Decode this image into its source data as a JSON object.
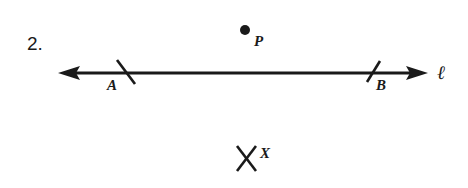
{
  "problem": {
    "number": "2."
  },
  "diagram": {
    "line": {
      "label": "ℓ",
      "x1": 58,
      "y1": 73,
      "x2": 428,
      "y2": 73,
      "arrows": "both"
    },
    "points": [
      {
        "name": "A",
        "label": "A",
        "type": "tick-mark",
        "x": 126,
        "y": 73
      },
      {
        "name": "B",
        "label": "B",
        "type": "tick-mark",
        "x": 373,
        "y": 73
      },
      {
        "name": "P",
        "label": "P",
        "type": "dot",
        "x": 245,
        "y": 30
      },
      {
        "name": "X",
        "label": "X",
        "type": "cross-mark",
        "x": 247,
        "y": 157
      }
    ],
    "colors": {
      "ink": "#1a1a1a",
      "background": "#ffffff"
    }
  }
}
